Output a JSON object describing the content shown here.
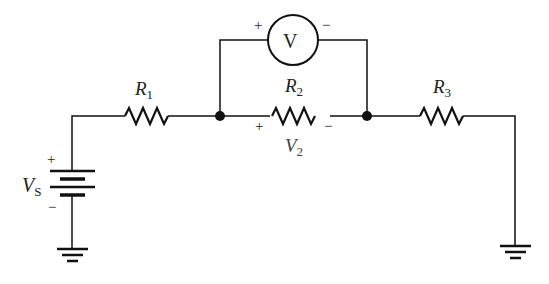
{
  "diagram": {
    "type": "circuit",
    "components": {
      "source": {
        "label": "V",
        "sub": "S",
        "plus": "+",
        "minus": "−"
      },
      "r1": {
        "label": "R",
        "sub": "1"
      },
      "r2": {
        "label": "R",
        "sub": "2"
      },
      "r3": {
        "label": "R",
        "sub": "3"
      },
      "voltmeter": {
        "label": "V",
        "plus": "+",
        "minus": "−"
      },
      "v2": {
        "label": "V",
        "sub": "2",
        "plus": "+",
        "minus": "−"
      }
    }
  }
}
